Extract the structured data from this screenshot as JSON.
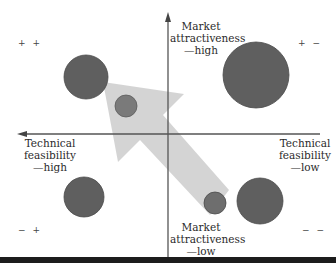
{
  "diagram": {
    "axes": {
      "top": "Market\nattractiveness\n—high",
      "bottom": "Market\nattractiveness\n—low",
      "left": "Technical\nfeasibility\n—high",
      "right": "Technical\nfeasibility\n—low"
    },
    "quadrants": {
      "top_left": "+ +",
      "top_right": "+ −",
      "bottom_left": "− +",
      "bottom_right": "− −"
    },
    "colors": {
      "circle": "#5f5f5f",
      "circle_stroke": "#4a4a4a",
      "circle_small": "#787878",
      "arrow": "#cfcfcf",
      "axis": "#555555"
    },
    "circles": [
      {
        "cx": 86,
        "cy": 77,
        "r": 22,
        "kind": "large"
      },
      {
        "cx": 126,
        "cy": 106,
        "r": 11,
        "kind": "small"
      },
      {
        "cx": 256,
        "cy": 75,
        "r": 33,
        "kind": "large"
      },
      {
        "cx": 84,
        "cy": 197,
        "r": 20,
        "kind": "large"
      },
      {
        "cx": 260,
        "cy": 201,
        "r": 23,
        "kind": "large"
      },
      {
        "cx": 215,
        "cy": 203,
        "r": 11,
        "kind": "small"
      }
    ]
  }
}
